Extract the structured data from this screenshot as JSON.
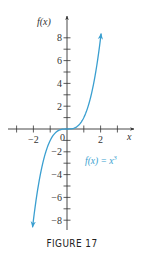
{
  "chart_data": {
    "type": "line",
    "title": "",
    "xlabel": "x",
    "ylabel": "f(x)",
    "xlim": [
      -3.5,
      3.9
    ],
    "ylim": [
      -8.8,
      9.8
    ],
    "x_ticks": [
      -3,
      -2,
      -1,
      1,
      2,
      3
    ],
    "x_tick_labels": {
      "-2": "−2",
      "2": "2"
    },
    "y_ticks": [
      -8,
      -7,
      -6,
      -5,
      -4,
      -3,
      -2,
      -1,
      1,
      2,
      3,
      4,
      5,
      6,
      7,
      8
    ],
    "y_tick_labels": {
      "8": "8",
      "6": "6",
      "4": "4",
      "2": "2",
      "-2": "−2",
      "-4": "−4",
      "-6": "−6",
      "-8": "−8"
    },
    "origin_label": "0",
    "grid": false,
    "series": [
      {
        "name": "f(x) = x³",
        "function": "x^3",
        "domain": [
          -2.05,
          2.03
        ],
        "color": "#3a9fd0",
        "arrows_at_ends": true,
        "x": [
          -2.0,
          -1.5,
          -1.0,
          -0.5,
          0,
          0.5,
          1.0,
          1.5,
          2.0
        ],
        "y": [
          -8,
          -3.375,
          -1,
          -0.125,
          0,
          0.125,
          1,
          3.375,
          8
        ]
      }
    ],
    "annotations": [
      {
        "text": "f(x) = x³",
        "x": 1.2,
        "y": -2.9,
        "color": "#3a9fd0"
      }
    ]
  },
  "figure": {
    "caption": "FIGURE 17",
    "function_label": "f(x) = x",
    "function_label_sup": "3",
    "y_axis_label": "f(x)",
    "x_axis_label": "x",
    "origin": "0"
  },
  "colors": {
    "curve": "#3a9fd0",
    "axis": "#333333",
    "text": "#333333"
  }
}
